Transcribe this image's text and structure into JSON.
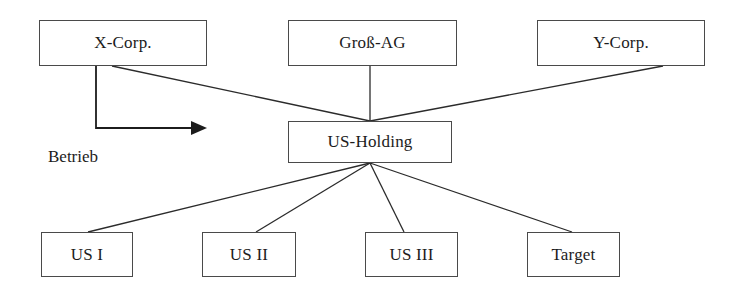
{
  "diagram": {
    "stroke_color": "#4a4a4a",
    "line_color": "#2b2b2b",
    "text_color": "#1c1c1c",
    "background": "#ffffff",
    "nodes": [
      {
        "id": "x-corp",
        "label": "X-Corp.",
        "x": 39,
        "y": 20,
        "w": 168,
        "h": 46
      },
      {
        "id": "gross-ag",
        "label": "Groß-AG",
        "x": 288,
        "y": 20,
        "w": 169,
        "h": 46
      },
      {
        "id": "y-corp",
        "label": "Y-Corp.",
        "x": 537,
        "y": 20,
        "w": 168,
        "h": 46
      },
      {
        "id": "us-holding",
        "label": "US-Holding",
        "x": 288,
        "y": 121,
        "w": 164,
        "h": 42
      },
      {
        "id": "us-i",
        "label": "US I",
        "x": 41,
        "y": 232,
        "w": 92,
        "h": 45
      },
      {
        "id": "us-ii",
        "label": "US II",
        "x": 202,
        "y": 232,
        "w": 94,
        "h": 45
      },
      {
        "id": "us-iii",
        "label": "US III",
        "x": 365,
        "y": 232,
        "w": 93,
        "h": 45
      },
      {
        "id": "target",
        "label": "Target",
        "x": 527,
        "y": 232,
        "w": 93,
        "h": 45
      }
    ],
    "edges": [
      {
        "id": "x-corp-to-us-holding",
        "from": "x-corp",
        "to": "us-holding",
        "x1": 112,
        "y1": 66,
        "x2": 370,
        "y2": 121
      },
      {
        "id": "gross-ag-to-us-holding",
        "from": "gross-ag",
        "to": "us-holding",
        "x1": 370,
        "y1": 66,
        "x2": 370,
        "y2": 121
      },
      {
        "id": "y-corp-to-us-holding",
        "from": "y-corp",
        "to": "us-holding",
        "x1": 663,
        "y1": 66,
        "x2": 370,
        "y2": 121
      },
      {
        "id": "us-holding-to-us-i",
        "from": "us-holding",
        "to": "us-i",
        "x1": 370,
        "y1": 163,
        "x2": 88,
        "y2": 232
      },
      {
        "id": "us-holding-to-us-ii",
        "from": "us-holding",
        "to": "us-ii",
        "x1": 370,
        "y1": 163,
        "x2": 256,
        "y2": 232
      },
      {
        "id": "us-holding-to-us-iii",
        "from": "us-holding",
        "to": "us-iii",
        "x1": 370,
        "y1": 163,
        "x2": 404,
        "y2": 232
      },
      {
        "id": "us-holding-to-target",
        "from": "us-holding",
        "to": "target",
        "x1": 370,
        "y1": 163,
        "x2": 572,
        "y2": 232
      }
    ],
    "arrows": [
      {
        "id": "betrieb-arrow",
        "label": "Betrieb",
        "from": "x-corp",
        "path": "M 96 66 L 96 128 L 203 128",
        "head_x": 207,
        "head_y": 128,
        "label_x": 48,
        "label_y": 147
      }
    ]
  }
}
